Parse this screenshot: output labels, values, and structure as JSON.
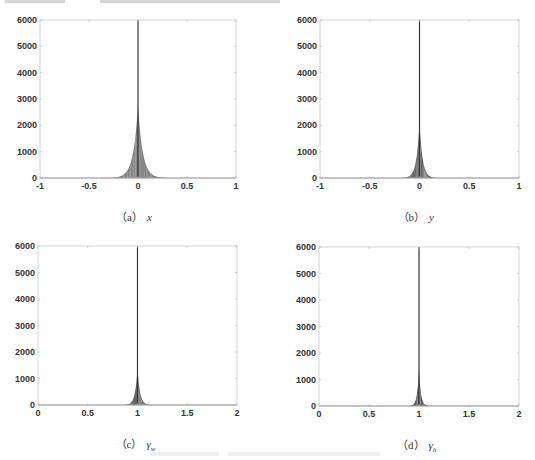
{
  "figure": {
    "panels": [
      {
        "id": "a",
        "caption_label": "（a）",
        "caption_var": "x",
        "caption_sub": "",
        "box": {
          "left": 40,
          "top": 20,
          "width": 196,
          "height": 158
        },
        "yticks": [
          "6000",
          "5000",
          "4000",
          "3000",
          "2000",
          "1000",
          "0"
        ],
        "xticks": [
          "-1",
          "-0.5",
          "0",
          "0.5",
          "1"
        ],
        "xlim": [
          -1,
          1
        ],
        "fill": "#7a7a7a"
      },
      {
        "id": "b",
        "caption_label": "（b）",
        "caption_var": "y",
        "caption_sub": "",
        "box": {
          "left": 320,
          "top": 20,
          "width": 199,
          "height": 158
        },
        "yticks": [
          "6000",
          "5000",
          "4000",
          "3000",
          "2000",
          "1000",
          "0"
        ],
        "xticks": [
          "-1",
          "-0.5",
          "0",
          "0.5",
          "1"
        ],
        "xlim": [
          -1,
          1
        ],
        "fill": "#555555"
      },
      {
        "id": "c",
        "caption_label": "（c）",
        "caption_var": "γ",
        "caption_sub": "w",
        "box": {
          "left": 38,
          "top": 246,
          "width": 199,
          "height": 159
        },
        "yticks": [
          "6000",
          "5000",
          "4000",
          "3000",
          "2000",
          "1000",
          "0"
        ],
        "xticks": [
          "0",
          "0.5",
          "1",
          "1.5",
          "2"
        ],
        "xlim": [
          0,
          2
        ],
        "fill": "#4a4a4a"
      },
      {
        "id": "d",
        "caption_label": "（d）",
        "caption_var": "γ",
        "caption_sub": "h",
        "box": {
          "left": 319,
          "top": 247,
          "width": 200,
          "height": 159
        },
        "yticks": [
          "6000",
          "5000",
          "4000",
          "3000",
          "2000",
          "1000",
          "0"
        ],
        "xticks": [
          "0",
          "0.5",
          "1",
          "1.5",
          "2"
        ],
        "xlim": [
          0,
          2
        ],
        "fill": "#2e2e2e"
      }
    ]
  },
  "chart_data": [
    {
      "type": "bar",
      "title": "(a) x",
      "xlabel": "x",
      "ylabel": "",
      "xlim": [
        -1,
        1
      ],
      "ylim": [
        0,
        6000
      ],
      "xticks": [
        -1,
        -0.5,
        0,
        0.5,
        1
      ],
      "yticks": [
        0,
        1000,
        2000,
        3000,
        4000,
        5000,
        6000
      ],
      "grid": false,
      "x": [
        -0.4,
        -0.3,
        -0.2,
        -0.15,
        -0.1,
        -0.05,
        -0.02,
        0,
        0.02,
        0.05,
        0.1,
        0.15,
        0.2,
        0.3,
        0.4
      ],
      "values": [
        10,
        60,
        250,
        550,
        1000,
        1800,
        2400,
        6000,
        2600,
        1800,
        1000,
        550,
        250,
        60,
        10
      ],
      "note": "histogram, peak spike at 0 reaching ~6000, body peak ~2700"
    },
    {
      "type": "bar",
      "title": "(b) y",
      "xlabel": "y",
      "ylabel": "",
      "xlim": [
        -1,
        1
      ],
      "ylim": [
        0,
        6000
      ],
      "xticks": [
        -1,
        -0.5,
        0,
        0.5,
        1
      ],
      "yticks": [
        0,
        1000,
        2000,
        3000,
        4000,
        5000,
        6000
      ],
      "grid": false,
      "x": [
        -0.25,
        -0.15,
        -0.1,
        -0.05,
        -0.02,
        0,
        0.02,
        0.05,
        0.1,
        0.15,
        0.25
      ],
      "values": [
        20,
        150,
        400,
        1000,
        1800,
        6000,
        2000,
        1000,
        400,
        150,
        20
      ],
      "note": "histogram, spike at 0 reaching ~6000, body peak ~2100"
    },
    {
      "type": "bar",
      "title": "(c) γ_w",
      "xlabel": "γ_w",
      "ylabel": "",
      "xlim": [
        0,
        2
      ],
      "ylim": [
        0,
        6000
      ],
      "xticks": [
        0,
        0.5,
        1,
        1.5,
        2
      ],
      "yticks": [
        0,
        1000,
        2000,
        3000,
        4000,
        5000,
        6000
      ],
      "grid": false,
      "x": [
        0.8,
        0.9,
        0.95,
        0.98,
        1.0,
        1.02,
        1.05,
        1.1,
        1.2
      ],
      "values": [
        20,
        150,
        500,
        1200,
        6000,
        1300,
        500,
        150,
        20
      ],
      "note": "histogram, spike at 1 reaching ~6000, body peak ~1900"
    },
    {
      "type": "bar",
      "title": "(d) γ_h",
      "xlabel": "γ_h",
      "ylabel": "",
      "xlim": [
        0,
        2
      ],
      "ylim": [
        0,
        6000
      ],
      "xticks": [
        0,
        0.5,
        1,
        1.5,
        2
      ],
      "yticks": [
        0,
        1000,
        2000,
        3000,
        4000,
        5000,
        6000
      ],
      "grid": false,
      "x": [
        0.85,
        0.92,
        0.96,
        0.99,
        1.0,
        1.01,
        1.04,
        1.08,
        1.15
      ],
      "values": [
        20,
        150,
        500,
        1300,
        6000,
        1300,
        500,
        150,
        20
      ],
      "note": "histogram, spike at 1 reaching ~6000, body peak ~1900"
    }
  ]
}
